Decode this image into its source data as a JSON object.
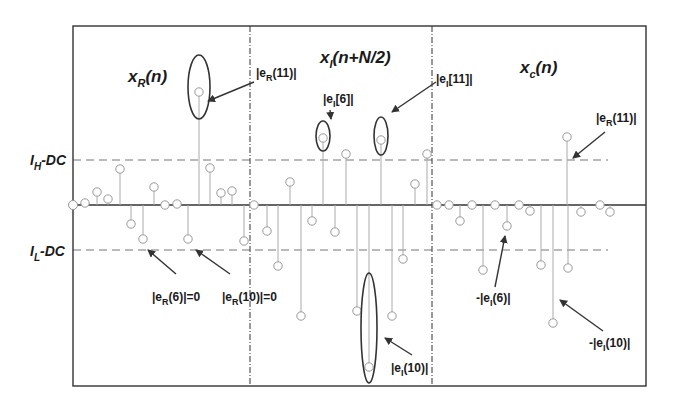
{
  "figure": {
    "frame": {
      "x0": 73,
      "y0": 26,
      "x1": 646,
      "y1": 386,
      "color": "#333333"
    },
    "baseline_y": 205,
    "dividers_x": [
      250,
      432
    ],
    "threshold_high": {
      "y": 160,
      "label": "I",
      "sub": "H",
      "suffix": "-DC",
      "label_x": 30,
      "label_y": 165
    },
    "threshold_low": {
      "y": 250,
      "label": "I",
      "sub": "L",
      "suffix": "-DC",
      "label_x": 30,
      "label_y": 256
    },
    "dashed_extent": {
      "x_start": 73,
      "x_end": 608
    },
    "colors": {
      "stem": "#aaaaaa",
      "marker": "#999999",
      "axis": "#333333",
      "dashed": "#777777",
      "ellipse": "#333333",
      "arrow": "#333333",
      "text": "#1a1a1a"
    }
  },
  "panels": [
    {
      "name": "real-part",
      "title": {
        "main": "x",
        "sub": "R",
        "tail": "(n)",
        "x": 128,
        "y": 82
      },
      "stems": [
        [
          73,
          205
        ],
        [
          85,
          203
        ],
        [
          97,
          192
        ],
        [
          108,
          199
        ],
        [
          120,
          169
        ],
        [
          131,
          224
        ],
        [
          143,
          239
        ],
        [
          154,
          187
        ],
        [
          165,
          205
        ],
        [
          177,
          204
        ],
        [
          188,
          239
        ],
        [
          199,
          92
        ],
        [
          210,
          168
        ],
        [
          221,
          193
        ],
        [
          232,
          191
        ],
        [
          244,
          241
        ],
        [
          254,
          205
        ]
      ]
    },
    {
      "name": "imag-part-shifted",
      "title": {
        "main": "x",
        "sub": "I",
        "tail": "(n+N/2)",
        "x": 320,
        "y": 63
      },
      "stems": [
        [
          267,
          231
        ],
        [
          278,
          266
        ],
        [
          290,
          182
        ],
        [
          301,
          316
        ],
        [
          312,
          221
        ],
        [
          323,
          138
        ],
        [
          335,
          232
        ],
        [
          346,
          154
        ],
        [
          357,
          311
        ],
        [
          369,
          367
        ],
        [
          381,
          140
        ],
        [
          392,
          316
        ],
        [
          403,
          259
        ],
        [
          415,
          184
        ],
        [
          427,
          154
        ],
        [
          437,
          205
        ]
      ]
    },
    {
      "name": "combined",
      "title": {
        "main": "x",
        "sub": "c",
        "tail": "(n)",
        "x": 520,
        "y": 73
      },
      "stems": [
        [
          449,
          205
        ],
        [
          460,
          221
        ],
        [
          472,
          205
        ],
        [
          483,
          270
        ],
        [
          495,
          205
        ],
        [
          507,
          226
        ],
        [
          519,
          205
        ],
        [
          530,
          211
        ],
        [
          541,
          265
        ],
        [
          553,
          323
        ],
        [
          567,
          137
        ],
        [
          568,
          268
        ],
        [
          581,
          212
        ],
        [
          600,
          205
        ],
        [
          610,
          212
        ]
      ]
    }
  ],
  "ellipses": [
    {
      "name": "eR11-ellipse",
      "cx": 199,
      "cy": 87,
      "rx": 11,
      "ry": 32
    },
    {
      "name": "eI6-ellipse",
      "cx": 323,
      "cy": 136,
      "rx": 7,
      "ry": 15
    },
    {
      "name": "eI11-ellipse",
      "cx": 381,
      "cy": 136,
      "rx": 7,
      "ry": 19
    },
    {
      "name": "eI10-ellipse",
      "cx": 369,
      "cy": 328,
      "rx": 8,
      "ry": 55
    }
  ],
  "annotations": [
    {
      "name": "label-eR11-top",
      "text_pre": "|e",
      "sub": "R",
      "text_post": "(11)|",
      "x": 256,
      "y": 77,
      "arrow": [
        [
          254,
          82
        ],
        [
          208,
          101
        ]
      ]
    },
    {
      "name": "label-eI6",
      "text_pre": "|e",
      "sub": "I",
      "text_post": "[6]|",
      "x": 323,
      "y": 103,
      "arrow": [
        [
          330,
          110
        ],
        [
          331,
          119
        ]
      ]
    },
    {
      "name": "label-eI11",
      "text_pre": "|e",
      "sub": "I",
      "text_post": "[11]|",
      "x": 436,
      "y": 83,
      "arrow": [
        [
          436,
          82
        ],
        [
          392,
          112
        ]
      ]
    },
    {
      "name": "label-eR11-right",
      "text_pre": "|e",
      "sub": "R",
      "text_post": "(11)|",
      "x": 596,
      "y": 122,
      "arrow": [
        [
          605,
          132
        ],
        [
          573,
          158
        ]
      ]
    },
    {
      "name": "label-eR6",
      "text_pre": "|e",
      "sub": "R",
      "text_post": "(6)|=0",
      "x": 152,
      "y": 301,
      "arrow": [
        [
          176,
          274
        ],
        [
          148,
          250
        ]
      ]
    },
    {
      "name": "label-eR10",
      "text_pre": "|e",
      "sub": "R",
      "text_post": "(10)|=0",
      "x": 222,
      "y": 301,
      "arrow": [
        [
          230,
          274
        ],
        [
          196,
          250
        ]
      ]
    },
    {
      "name": "label-eI10-mid",
      "text_pre": "|e",
      "sub": "I",
      "text_post": "(10)|",
      "x": 391,
      "y": 372,
      "arrow": [
        [
          412,
          355
        ],
        [
          385,
          338
        ]
      ]
    },
    {
      "name": "label-neg-eI6",
      "text_pre": "-|e",
      "sub": "I",
      "text_post": "(6)|",
      "x": 476,
      "y": 302,
      "arrow": [
        [
          495,
          287
        ],
        [
          505,
          236
        ]
      ]
    },
    {
      "name": "label-neg-eI10",
      "text_pre": "-|e",
      "sub": "I",
      "text_post": "(10)|",
      "x": 589,
      "y": 347,
      "arrow": [
        [
          603,
          331
        ],
        [
          560,
          300
        ]
      ]
    }
  ]
}
